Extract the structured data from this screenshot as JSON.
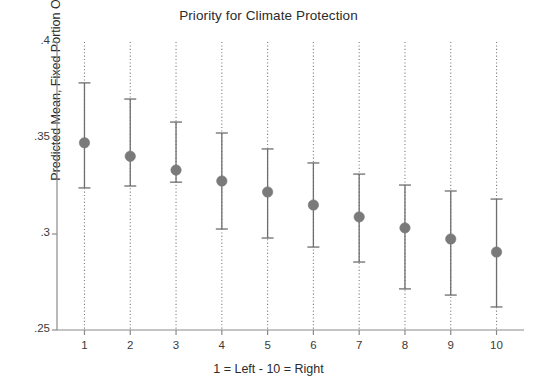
{
  "chart_data": {
    "type": "scatter",
    "title": "Priority for Climate Protection",
    "xlabel": "1 = Left - 10 = Right",
    "ylabel": "Predicted Mean, Fixed Portion Only",
    "grid": "vertical-dotted",
    "legend": "none",
    "xlim": [
      0.4,
      10.6
    ],
    "ylim": [
      0.25,
      0.4
    ],
    "xticks": [
      1,
      2,
      3,
      4,
      5,
      6,
      7,
      8,
      9,
      10
    ],
    "xtick_labels": [
      "1",
      "2",
      "3",
      "4",
      "5",
      "6",
      "7",
      "8",
      "9",
      "10"
    ],
    "yticks": [
      0.25,
      0.3,
      0.35,
      0.4
    ],
    "ytick_labels": [
      ".25",
      ".3",
      ".35",
      ".4"
    ],
    "marker_color": "#7a7a7a",
    "errorbar_color": "#6e6e6e",
    "axis_color": "#8a8a8a",
    "categories": [
      "1",
      "2",
      "3",
      "4",
      "5",
      "6",
      "7",
      "8",
      "9",
      "10"
    ],
    "series": [
      {
        "name": "Predicted Mean, Fixed Portion Only",
        "x": [
          1,
          2,
          3,
          4,
          5,
          6,
          7,
          8,
          9,
          10
        ],
        "values": [
          0.3475,
          0.3405,
          0.3333,
          0.3276,
          0.3219,
          0.3151,
          0.3089,
          0.3032,
          0.2974,
          0.2906
        ],
        "ci_low": [
          0.324,
          0.325,
          0.327,
          0.3026,
          0.2979,
          0.2932,
          0.2854,
          0.2714,
          0.2682,
          0.262
        ],
        "ci_high": [
          0.3787,
          0.3703,
          0.3583,
          0.3526,
          0.3443,
          0.337,
          0.3312,
          0.3255,
          0.3224,
          0.3182
        ]
      }
    ]
  }
}
